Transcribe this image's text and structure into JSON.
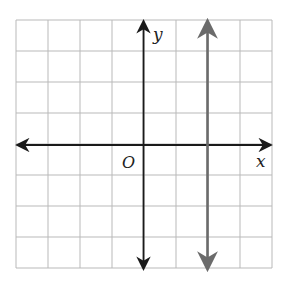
{
  "chart_data": {
    "type": "line",
    "title": "",
    "xlabel": "x",
    "ylabel": "y",
    "origin_label": "O",
    "xlim": [
      -4,
      4
    ],
    "ylim": [
      -4,
      4
    ],
    "grid": true,
    "grid_step": 1,
    "tick_labels_shown": false,
    "series": [
      {
        "name": "vertical line x = 2",
        "equation": "x = 2",
        "points": [
          [
            2,
            -4
          ],
          [
            2,
            4
          ]
        ],
        "arrows_both_ends": true,
        "color": "#6b6b6b"
      }
    ],
    "axes": {
      "color": "#1a1a1a",
      "arrows_both_ends": true
    }
  },
  "colors": {
    "grid": "#b9b9b9",
    "axes": "#1a1a1a",
    "line": "#6b6b6b",
    "background": "#ffffff"
  }
}
